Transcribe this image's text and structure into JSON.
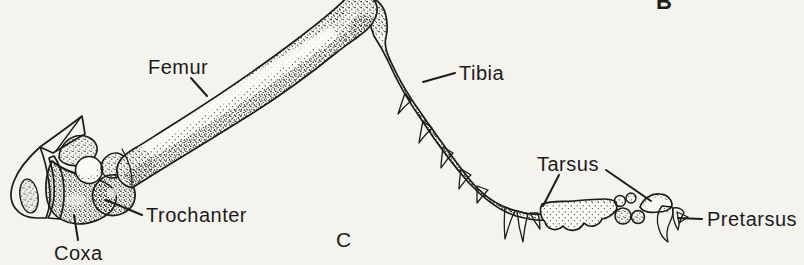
{
  "figure": {
    "labels": {
      "femur": "Femur",
      "tibia": "Tibia",
      "trochanter": "Trochanter",
      "coxa": "Coxa",
      "tarsus": "Tarsus",
      "pretarsus": "Pretarsus"
    },
    "panel_letters": {
      "top_right": "B",
      "bottom_center": "C"
    }
  },
  "colors": {
    "background": "#f5f3ee",
    "bone": "#fbfaf6",
    "ink": "#1b1b1b"
  }
}
